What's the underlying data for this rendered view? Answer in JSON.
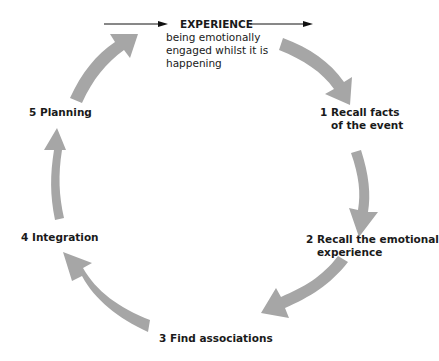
{
  "diagram": {
    "type": "cycle",
    "title": "EXPERIENCE",
    "title_description": "being emotionally engaged whilst it is happening",
    "title_description_lines": [
      "being emotionally",
      "engaged whilst it is",
      "happening"
    ],
    "arrow_color": "#a6a6a6",
    "stages": [
      {
        "number": "1",
        "label": "Recall facts",
        "label_line2": "of the event",
        "full": "1 Recall facts of the event"
      },
      {
        "number": "2",
        "label": "Recall the emotional",
        "label_line2": "experience",
        "full": "2 Recall the emotional experience"
      },
      {
        "number": "3",
        "label": "Find associations",
        "full": "3 Find associations"
      },
      {
        "number": "4",
        "label": "Integration",
        "full": "4 Integration"
      },
      {
        "number": "5",
        "label": "Planning",
        "full": "5 Planning"
      }
    ],
    "flow": [
      "EXPERIENCE",
      "1 Recall facts of the event",
      "2 Recall the emotional experience",
      "3 Find associations",
      "4 Integration",
      "5 Planning",
      "EXPERIENCE"
    ]
  }
}
